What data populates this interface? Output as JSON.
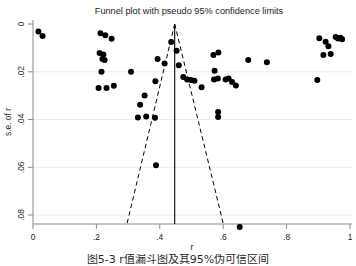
{
  "chart_data": {
    "type": "scatter",
    "title": "Funnel plot with pseudo 95% confidence limits",
    "xlabel": "r",
    "ylabel": "s.e. of r",
    "xlim": [
      0,
      1
    ],
    "ylim": [
      0,
      0.088
    ],
    "y_inverted": true,
    "grid": true,
    "legend": "none",
    "xticks": [
      0,
      0.2,
      0.4,
      0.6,
      0.8,
      1
    ],
    "xticklabels": [
      "0",
      ".2",
      ".4",
      ".6",
      ".8",
      "1"
    ],
    "yticks": [
      0,
      0.02,
      0.04,
      0.06,
      0.08
    ],
    "yticklabels": [
      "0",
      ".02",
      ".04",
      ".06",
      ".08"
    ],
    "marker": {
      "shape": "circle",
      "color": "#000000",
      "size": 3.0
    },
    "reference_line": {
      "type": "vertical",
      "x": 0.447,
      "color": "#000000",
      "style": "solid",
      "label": "pooled effect"
    },
    "confidence_limits": {
      "style": "dashed",
      "color": "#000000",
      "apex": {
        "x": 0.447,
        "y": 0
      },
      "left_end": {
        "x": 0.297,
        "y": 0.0835
      },
      "right_end": {
        "x": 0.6,
        "y": 0.0835
      }
    },
    "points": [
      {
        "x": 0.017,
        "y": 0.0032
      },
      {
        "x": 0.03,
        "y": 0.005
      },
      {
        "x": 0.213,
        "y": 0.0039
      },
      {
        "x": 0.228,
        "y": 0.0047
      },
      {
        "x": 0.248,
        "y": 0.0062
      },
      {
        "x": 0.21,
        "y": 0.0121
      },
      {
        "x": 0.222,
        "y": 0.0128
      },
      {
        "x": 0.219,
        "y": 0.0147
      },
      {
        "x": 0.226,
        "y": 0.0151
      },
      {
        "x": 0.216,
        "y": 0.02
      },
      {
        "x": 0.207,
        "y": 0.0268
      },
      {
        "x": 0.232,
        "y": 0.0268
      },
      {
        "x": 0.255,
        "y": 0.0259
      },
      {
        "x": 0.309,
        "y": 0.02
      },
      {
        "x": 0.338,
        "y": 0.0338
      },
      {
        "x": 0.331,
        "y": 0.0392
      },
      {
        "x": 0.357,
        "y": 0.0387
      },
      {
        "x": 0.385,
        "y": 0.0393
      },
      {
        "x": 0.352,
        "y": 0.0299
      },
      {
        "x": 0.386,
        "y": 0.024
      },
      {
        "x": 0.393,
        "y": 0.0146
      },
      {
        "x": 0.415,
        "y": 0.0166
      },
      {
        "x": 0.388,
        "y": 0.0592
      },
      {
        "x": 0.436,
        "y": 0.0075
      },
      {
        "x": 0.453,
        "y": 0.0112
      },
      {
        "x": 0.46,
        "y": 0.0173
      },
      {
        "x": 0.474,
        "y": 0.0222
      },
      {
        "x": 0.486,
        "y": 0.0232
      },
      {
        "x": 0.498,
        "y": 0.0234
      },
      {
        "x": 0.509,
        "y": 0.0238
      },
      {
        "x": 0.532,
        "y": 0.0265
      },
      {
        "x": 0.569,
        "y": 0.013
      },
      {
        "x": 0.585,
        "y": 0.012
      },
      {
        "x": 0.573,
        "y": 0.0196
      },
      {
        "x": 0.571,
        "y": 0.0232
      },
      {
        "x": 0.583,
        "y": 0.0228
      },
      {
        "x": 0.608,
        "y": 0.0232
      },
      {
        "x": 0.617,
        "y": 0.0228
      },
      {
        "x": 0.628,
        "y": 0.0243
      },
      {
        "x": 0.64,
        "y": 0.0258
      },
      {
        "x": 0.584,
        "y": 0.0368
      },
      {
        "x": 0.584,
        "y": 0.039
      },
      {
        "x": 0.652,
        "y": 0.085
      },
      {
        "x": 0.679,
        "y": 0.0151
      },
      {
        "x": 0.738,
        "y": 0.016
      },
      {
        "x": 0.897,
        "y": 0.0235
      },
      {
        "x": 0.903,
        "y": 0.006
      },
      {
        "x": 0.923,
        "y": 0.0074
      },
      {
        "x": 0.932,
        "y": 0.0093
      },
      {
        "x": 0.939,
        "y": 0.0126
      },
      {
        "x": 0.916,
        "y": 0.013
      },
      {
        "x": 0.955,
        "y": 0.0055
      },
      {
        "x": 0.962,
        "y": 0.0061
      },
      {
        "x": 0.97,
        "y": 0.0058
      },
      {
        "x": 0.975,
        "y": 0.0064
      }
    ]
  },
  "caption": {
    "text": "图5-3  r值漏斗图及其95%伪可信区间"
  }
}
